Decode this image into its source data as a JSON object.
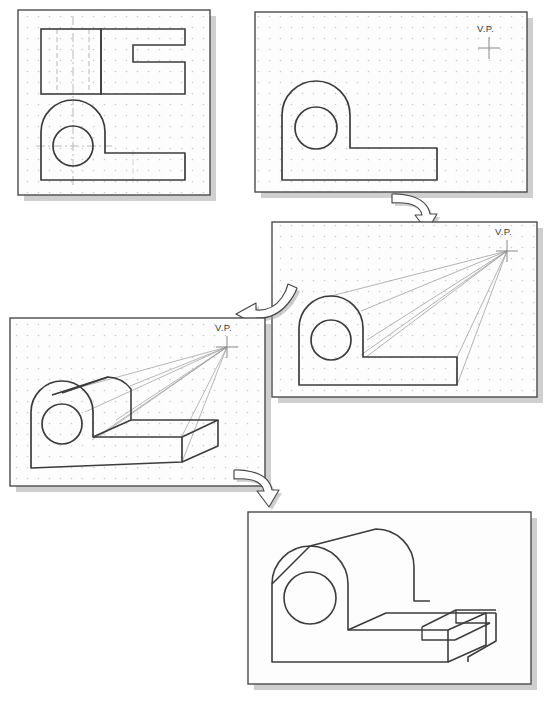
{
  "figure": {
    "background_color": "#ffffff",
    "panel_fill": "#fdfdfd",
    "panel_border_color": "#4a4a4a",
    "shadow_color": "#a8a8a8",
    "object_line_color": "#3c3c3c",
    "projection_line_color": "#9a9a9a",
    "hidden_line_color": "#b4b4b4",
    "center_line_color": "#a0a0a0",
    "grid_dot_color": "#c9c9c9",
    "arrow_fill": "#ffffff",
    "arrow_stroke": "#4a4a4a",
    "arrow_shadow": "#9e9e9e"
  },
  "panels": [
    {
      "id": "panel-1",
      "step": 1,
      "name": "orthographic-views",
      "caption": "",
      "x": 18,
      "y": 10,
      "w": 192,
      "h": 185,
      "vp_label": "",
      "has_vp": false,
      "description": "Top view rectangle with hidden lines and C-shaped profile; front view with arch, hole and L base"
    },
    {
      "id": "panel-2",
      "step": 2,
      "name": "front-view-with-vanishing-point",
      "caption": "",
      "x": 255,
      "y": 12,
      "w": 272,
      "h": 180,
      "vp_label": "V.P.",
      "has_vp": true,
      "vp_x": 489,
      "vp_y": 48,
      "description": "Front view traced, vanishing point located to the upper right"
    },
    {
      "id": "panel-3",
      "step": 3,
      "name": "projection-lines-to-vp",
      "caption": "",
      "x": 272,
      "y": 222,
      "w": 265,
      "h": 175,
      "vp_label": "V.P.",
      "has_vp": true,
      "vp_x": 507,
      "vp_y": 251,
      "description": "Projection lines drawn from object corners toward the vanishing point"
    },
    {
      "id": "panel-4",
      "step": 4,
      "name": "depth-established",
      "caption": "",
      "x": 10,
      "y": 318,
      "w": 255,
      "h": 168,
      "vp_label": "V.P.",
      "has_vp": true,
      "vp_x": 227,
      "vp_y": 347,
      "description": "Depth measured along projectors, back edges added to form the solid"
    },
    {
      "id": "panel-5",
      "step": 5,
      "name": "completed-perspective",
      "caption": "",
      "x": 248,
      "y": 512,
      "w": 283,
      "h": 172,
      "vp_label": "",
      "has_vp": false,
      "description": "Construction lines removed, completed one-point perspective with slot detail"
    }
  ],
  "arrows": [
    {
      "id": "arrow-1",
      "name": "step-arrow-1-to-2",
      "from_panel": "panel-2",
      "to_panel": "panel-3",
      "direction": "down-right",
      "x": 390,
      "y": 190
    },
    {
      "id": "arrow-2",
      "name": "step-arrow-2-to-3",
      "from_panel": "panel-3",
      "to_panel": "panel-4",
      "direction": "down-left",
      "x": 232,
      "y": 282
    },
    {
      "id": "arrow-3",
      "name": "step-arrow-3-to-4",
      "from_panel": "panel-4",
      "to_panel": "panel-5",
      "direction": "down-right",
      "x": 232,
      "y": 466
    }
  ],
  "labels": {
    "vanishing_point": "V.P."
  }
}
